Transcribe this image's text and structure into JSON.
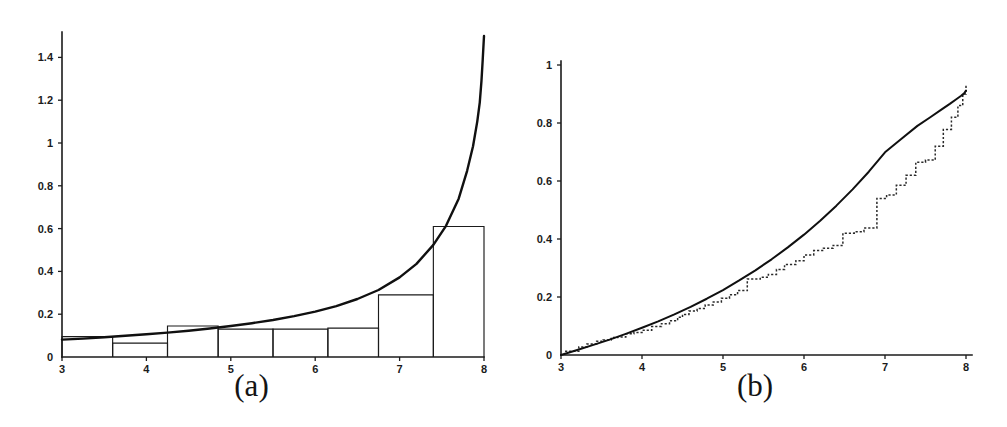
{
  "figure": {
    "panels": [
      {
        "id": "a",
        "caption": "(a)"
      },
      {
        "id": "b",
        "caption": "(b)"
      }
    ]
  },
  "chart_data": [
    {
      "type": "bar",
      "panel": "a",
      "title": "",
      "subtitle": "",
      "xlabel": "",
      "ylabel": "",
      "caption": "(a)",
      "xlim": [
        3,
        8
      ],
      "ylim": [
        0,
        1.5
      ],
      "xticks": [
        3,
        4,
        5,
        6,
        7,
        8
      ],
      "xtick_labels": [
        "3",
        "4",
        "5",
        "6",
        "7",
        "8"
      ],
      "yticks": [
        0,
        0.2,
        0.4,
        0.6,
        0.8,
        1,
        1.2,
        1.4
      ],
      "ytick_labels": [
        "0",
        "0.2",
        "0.4",
        "0.6",
        "0.8",
        "1",
        "1.2",
        "1.4"
      ],
      "grid": false,
      "legend": "none",
      "annotations": [],
      "description": "Histogram of observed data with a fitted probability density curve overlaid; density rises steeply near the right boundary x = 8.",
      "series": [
        {
          "name": "histogram",
          "type": "bar",
          "bin_edges": [
            3.0,
            3.6,
            4.25,
            4.85,
            5.5,
            6.15,
            6.75,
            7.4,
            8.0
          ],
          "values": [
            0.095,
            0.065,
            0.145,
            0.13,
            0.13,
            0.135,
            0.29,
            0.61
          ]
        },
        {
          "name": "fitted density",
          "type": "line",
          "x": [
            3.0,
            3.25,
            3.5,
            3.75,
            4.0,
            4.25,
            4.5,
            4.75,
            5.0,
            5.25,
            5.5,
            5.75,
            6.0,
            6.25,
            6.5,
            6.75,
            7.0,
            7.2,
            7.4,
            7.55,
            7.7,
            7.8,
            7.87,
            7.92,
            7.95,
            7.97,
            7.985,
            8.0
          ],
          "y": [
            0.081,
            0.086,
            0.092,
            0.099,
            0.106,
            0.114,
            0.123,
            0.133,
            0.145,
            0.158,
            0.173,
            0.191,
            0.212,
            0.238,
            0.271,
            0.313,
            0.372,
            0.435,
            0.524,
            0.613,
            0.74,
            0.87,
            0.985,
            1.1,
            1.19,
            1.29,
            1.39,
            1.5
          ]
        }
      ]
    },
    {
      "type": "line",
      "panel": "b",
      "title": "",
      "subtitle": "",
      "xlabel": "",
      "ylabel": "",
      "caption": "(b)",
      "xlim": [
        3,
        8
      ],
      "ylim": [
        0,
        1
      ],
      "xticks": [
        3,
        4,
        5,
        6,
        7,
        8
      ],
      "xtick_labels": [
        "3",
        "4",
        "5",
        "6",
        "7",
        "8"
      ],
      "yticks": [
        0,
        0.2,
        0.4,
        0.6,
        0.8,
        1
      ],
      "ytick_labels": [
        "0",
        "0.2",
        "0.4",
        "0.6",
        "0.8",
        "1"
      ],
      "grid": false,
      "legend": "none",
      "annotations": [],
      "description": "Empirical cumulative distribution function (dotted staircase) compared against the fitted theoretical CDF (smooth solid curve) over the range 3 to 8.",
      "series": [
        {
          "name": "fitted CDF",
          "type": "line",
          "x": [
            3.0,
            3.2,
            3.4,
            3.6,
            3.8,
            4.0,
            4.2,
            4.4,
            4.6,
            4.8,
            5.0,
            5.2,
            5.4,
            5.6,
            5.8,
            6.0,
            6.2,
            6.4,
            6.6,
            6.8,
            7.0,
            7.2,
            7.4,
            7.55,
            7.7,
            7.8,
            7.88,
            7.94,
            7.98,
            8.0
          ],
          "y": [
            0.0,
            0.017,
            0.035,
            0.053,
            0.073,
            0.094,
            0.116,
            0.14,
            0.166,
            0.194,
            0.224,
            0.257,
            0.292,
            0.33,
            0.371,
            0.415,
            0.463,
            0.515,
            0.571,
            0.632,
            0.699,
            0.745,
            0.79,
            0.818,
            0.847,
            0.866,
            0.882,
            0.894,
            0.903,
            0.912
          ]
        },
        {
          "name": "empirical CDF",
          "type": "step",
          "x": [
            3.13,
            3.22,
            3.32,
            3.44,
            3.52,
            3.62,
            3.7,
            3.8,
            3.9,
            4.0,
            4.12,
            4.24,
            4.34,
            4.44,
            4.5,
            4.58,
            4.68,
            4.78,
            4.88,
            4.98,
            5.08,
            5.18,
            5.3,
            5.46,
            5.56,
            5.66,
            5.76,
            5.9,
            6.0,
            6.12,
            6.24,
            6.36,
            6.48,
            6.62,
            6.74,
            6.9,
            7.02,
            7.14,
            7.26,
            7.38,
            7.5,
            7.62,
            7.72,
            7.82,
            7.9,
            7.96,
            8.0
          ],
          "y": [
            0.013,
            0.028,
            0.038,
            0.047,
            0.052,
            0.06,
            0.062,
            0.073,
            0.078,
            0.085,
            0.098,
            0.108,
            0.118,
            0.13,
            0.14,
            0.152,
            0.16,
            0.172,
            0.183,
            0.196,
            0.208,
            0.222,
            0.262,
            0.268,
            0.278,
            0.295,
            0.312,
            0.325,
            0.345,
            0.36,
            0.368,
            0.378,
            0.42,
            0.425,
            0.438,
            0.54,
            0.552,
            0.585,
            0.62,
            0.665,
            0.672,
            0.72,
            0.778,
            0.82,
            0.86,
            0.9,
            0.93
          ]
        }
      ]
    }
  ]
}
